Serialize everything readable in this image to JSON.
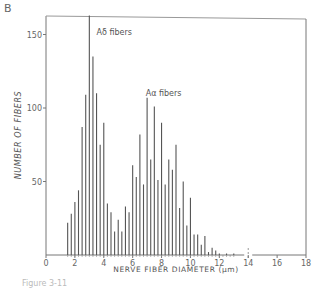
{
  "panel_label": "B",
  "caption": "Figure 3-11",
  "chart_data": {
    "type": "bar",
    "title": "",
    "xlabel": "NERVE FIBER DIAMETER (μm)",
    "ylabel": "NUMBER OF FIBERS",
    "xlim": [
      0,
      18
    ],
    "ylim": [
      0,
      163
    ],
    "xticks": [
      0,
      2,
      4,
      6,
      8,
      10,
      12,
      14,
      16,
      18
    ],
    "yticks": [
      50,
      100,
      150
    ],
    "grid": false,
    "legend": null,
    "annotations": [
      {
        "text": "Aδ fibers",
        "x": 3.5,
        "y": 150
      },
      {
        "text": "Aα fibers",
        "x": 6.9,
        "y": 108
      }
    ],
    "axis_break_at": 14,
    "x": [
      1.5,
      1.75,
      2.0,
      2.25,
      2.5,
      2.75,
      3.0,
      3.25,
      3.5,
      3.75,
      4.0,
      4.25,
      4.5,
      4.75,
      5.0,
      5.25,
      5.5,
      5.75,
      6.0,
      6.25,
      6.5,
      6.75,
      7.0,
      7.25,
      7.5,
      7.75,
      8.0,
      8.25,
      8.5,
      8.75,
      9.0,
      9.25,
      9.5,
      9.75,
      10.0,
      10.25,
      10.5,
      10.75,
      11.0,
      11.25,
      11.5,
      11.75,
      12.0,
      12.5,
      13.0,
      14.0
    ],
    "values": [
      22,
      28,
      36,
      44,
      87,
      109,
      163,
      135,
      110,
      75,
      90,
      35,
      29,
      16,
      24,
      16,
      33,
      29,
      61,
      53,
      82,
      48,
      107,
      65,
      101,
      51,
      90,
      48,
      65,
      58,
      75,
      32,
      50,
      20,
      39,
      14,
      14,
      7,
      13,
      2,
      5,
      3,
      1,
      1,
      1,
      2
    ]
  }
}
